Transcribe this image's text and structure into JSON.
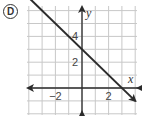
{
  "option": {
    "label": "D"
  },
  "chart_data": {
    "type": "line",
    "title": "",
    "xlabel": "x",
    "ylabel": "y",
    "xlim": [
      -4,
      4
    ],
    "ylim": [
      -2,
      6
    ],
    "grid": true,
    "x_tick_labels": [
      {
        "value": -2,
        "label": "−2"
      },
      {
        "value": 2,
        "label": "2"
      }
    ],
    "y_tick_labels": [
      {
        "value": 2,
        "label": "2"
      },
      {
        "value": 4,
        "label": "4"
      }
    ],
    "series": [
      {
        "name": "line",
        "equation": "y = -x + 3",
        "slope": -1,
        "intercept": 3,
        "x": [
          -3.9,
          0,
          3,
          4.0
        ],
        "y": [
          6.9,
          3,
          0,
          -1.0
        ],
        "arrows": "both",
        "color": "#2b2b2b"
      }
    ]
  },
  "colors": {
    "grid": "#c8c8c8",
    "axis": "#2b2b2b",
    "line": "#2b2b2b",
    "text": "#444444"
  }
}
